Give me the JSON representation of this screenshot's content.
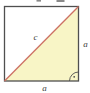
{
  "figure": {
    "labels": {
      "diagonal": "c",
      "right_side": "a",
      "bottom_side": "a"
    },
    "colors": {
      "background": "#ffffff",
      "square_border": "#4f4f4f",
      "triangle_fill": "#f8f5c6",
      "diagonal_line": "#cd7164",
      "label_text": "#3c3c3c",
      "angle_marker": "#4f4f4f",
      "clipped_fragment": "#8a8a8a"
    },
    "angle_marker": {
      "icon": "right-angle-arc-dot-icon"
    }
  }
}
